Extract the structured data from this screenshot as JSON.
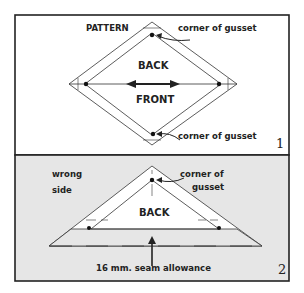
{
  "panel1": {
    "pattern_label": "PATTERN",
    "corner_top_label": "corner of gusset",
    "back_label": "BACK",
    "front_label": "FRONT",
    "corner_bottom_label": "corner of gusset",
    "panel_number": "1"
  },
  "panel2": {
    "wrong_side_line1": "wrong",
    "wrong_side_line2": "side",
    "corner_line1": "corner of",
    "corner_line2": "gusset",
    "back_label": "BACK",
    "seam_label": "16 mm.  seam allowance",
    "panel_number": "2",
    "background_color": "#e6e6e6"
  }
}
